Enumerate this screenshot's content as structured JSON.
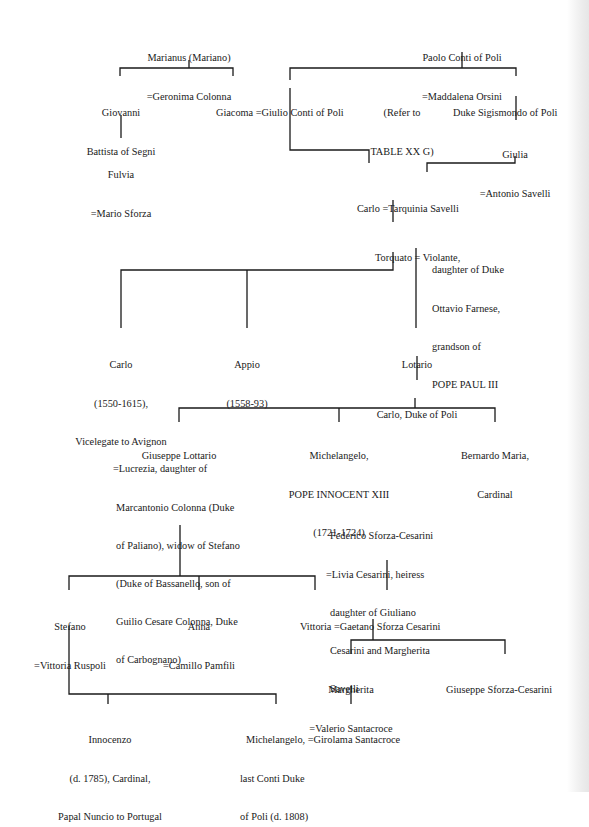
{
  "diagram": {
    "type": "family-tree",
    "nodes": {
      "marianus": {
        "lines": [
          "Marianus (Mariano)",
          "=Geronima Colonna"
        ]
      },
      "paolo": {
        "lines": [
          "Paolo Conti of Poli",
          "=Maddalena Orsini"
        ]
      },
      "giovanni": {
        "lines": [
          "Giovanni",
          "Battista of Segni"
        ]
      },
      "giacoma": {
        "lines": [
          "Giacoma =Giulio Conti of Poli"
        ]
      },
      "refer": {
        "lines": [
          "(Refer to",
          "TABLE XX G)"
        ]
      },
      "sigismondo": {
        "lines": [
          "Duke Sigismondo of Poli"
        ]
      },
      "fulvia": {
        "lines": [
          "Fulvia",
          "=Mario Sforza"
        ]
      },
      "giulia": {
        "lines": [
          "Giulia",
          "=Antonio Savelli"
        ]
      },
      "carlo1": {
        "lines": [
          "Carlo =Tarquinia Savelli"
        ]
      },
      "torquato": {
        "lines": [
          "Torquato = Violante,"
        ]
      },
      "violante_note": {
        "lines": [
          "daughter of Duke",
          "Ottavio Farnese,",
          "grandson of",
          "POPE PAUL III"
        ]
      },
      "carlo2": {
        "lines": [
          "Carlo",
          "(1550-1615),",
          "Vicelegate to Avignon"
        ]
      },
      "appio": {
        "lines": [
          "Appio",
          "(1558-93)"
        ]
      },
      "lotario": {
        "lines": [
          "Lotario"
        ]
      },
      "carlo_duke": {
        "lines": [
          "Carlo, Duke of Poli"
        ]
      },
      "giuseppe_l": {
        "lines": [
          "Giuseppe Lottario"
        ]
      },
      "giuseppe_l_spouse": {
        "lines": [
          "=Lucrezia, daughter of",
          "Marcantonio Colonna (Duke",
          "of Paliano), widow of Stefano",
          "(Duke of Bassanello, son of",
          "Guilio Cesare Colonna, Duke",
          "of Carbognano)"
        ]
      },
      "michelangelo_pope": {
        "lines": [
          "Michelangelo,",
          "POPE INNOCENT XIII",
          "(1721-1724)"
        ]
      },
      "bernardo": {
        "lines": [
          "Bernardo Maria,",
          "Cardinal"
        ]
      },
      "federico": {
        "lines": [
          "Federico Sforza-Cesarini",
          "=Livia Cesarini, heiress",
          "daughter of Giuliano",
          "Cesarini and Margherita",
          "Savelli"
        ]
      },
      "stefano": {
        "lines": [
          "Stefano",
          "=Vittoria Ruspoli"
        ]
      },
      "anna": {
        "lines": [
          "Anna",
          "=Camillo Pamfili"
        ]
      },
      "vittoria": {
        "lines": [
          "Vittoria =Gaetano Sforza Cesarini"
        ]
      },
      "margherita": {
        "lines": [
          "Margherita",
          "=Valerio Santacroce"
        ]
      },
      "giuseppe_sc": {
        "lines": [
          "Giuseppe Sforza-Cesarini"
        ]
      },
      "innocenzo": {
        "lines": [
          "Innocenzo",
          "(d. 1785), Cardinal,",
          "Papal Nuncio to Portugal"
        ]
      },
      "michelangelo_last": {
        "lines": [
          "Michelangelo, =Girolama Santacroce",
          "last Conti Duke",
          "of Poli (d. 1808)"
        ]
      }
    },
    "colors": {
      "ink": "#1a1a1a",
      "paper": "#ffffff"
    }
  }
}
